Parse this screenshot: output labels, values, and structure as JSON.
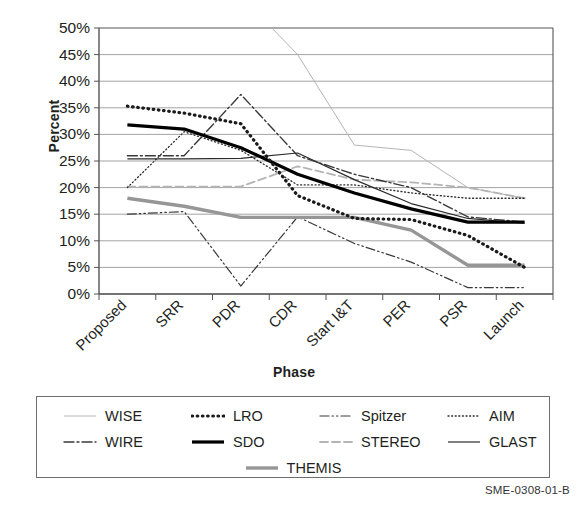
{
  "caption": "SME-0308-01-B",
  "top_partial_text": "",
  "axis": {
    "ylabel": "Percent",
    "xlabel": "Phase"
  },
  "chart_data": {
    "type": "line",
    "title": "",
    "xlabel": "Phase",
    "ylabel": "Percent",
    "ylim": [
      0,
      50
    ],
    "ytick_labels": [
      "0%",
      "5%",
      "10%",
      "15%",
      "20%",
      "25%",
      "30%",
      "35%",
      "40%",
      "45%",
      "50%"
    ],
    "ytick_values": [
      0,
      5,
      10,
      15,
      20,
      25,
      30,
      35,
      40,
      45,
      50
    ],
    "grid": true,
    "legend_position": "below",
    "categories": [
      "Proposed",
      "SRR",
      "PDR",
      "CDR",
      "Start I&T",
      "PER",
      "PSR",
      "Launch"
    ],
    "series": [
      {
        "name": "WISE",
        "style": "thin-solid-light",
        "color": "#b4b4b4",
        "width": 1,
        "dash": "none",
        "values": [
          null,
          null,
          56,
          45,
          28,
          27,
          20,
          18
        ]
      },
      {
        "name": "WIRE",
        "style": "dash-dot",
        "color": "#3a3a3a",
        "width": 1.4,
        "dash": "10,3,2,3",
        "values": [
          26,
          26,
          37.5,
          26,
          22.5,
          20,
          14.5,
          13.5
        ]
      },
      {
        "name": "LRO",
        "style": "thick-dotted",
        "color": "#1a1a1a",
        "width": 3.2,
        "dash": "0.6,4.6",
        "values": [
          35.3,
          34,
          32,
          18.5,
          14.2,
          14,
          11,
          5
        ]
      },
      {
        "name": "SDO",
        "style": "thick-solid",
        "color": "#000000",
        "width": 3.2,
        "dash": "none",
        "values": [
          31.8,
          31,
          27.5,
          22.5,
          19,
          16,
          13.5,
          13.5
        ]
      },
      {
        "name": "Spitzer",
        "style": "dash-dot-dot",
        "color": "#3a3a3a",
        "width": 1.2,
        "dash": "9,3,1.5,3,1.5,3",
        "values": [
          15,
          15.5,
          1.5,
          14.5,
          9.5,
          6,
          1.2,
          1.2
        ]
      },
      {
        "name": "STEREO",
        "style": "dashed-light",
        "color": "#b4b4b4",
        "width": 1.8,
        "dash": "8,4",
        "values": [
          20.2,
          20.2,
          20.2,
          24,
          21.5,
          21,
          20,
          18
        ]
      },
      {
        "name": "AIM",
        "style": "fine-dotted",
        "color": "#2a2a2a",
        "width": 1.3,
        "dash": "1,2.6",
        "values": [
          20,
          30.5,
          27,
          20.5,
          20.5,
          19,
          18,
          18
        ]
      },
      {
        "name": "GLAST",
        "style": "thin-solid",
        "color": "#2a2a2a",
        "width": 1.2,
        "dash": "none",
        "values": [
          25.4,
          25.4,
          25.5,
          26.5,
          21.5,
          17,
          14.2,
          13.3
        ]
      },
      {
        "name": "THEMIS",
        "style": "thick-solid-gray",
        "color": "#969696",
        "width": 3.4,
        "dash": "none",
        "values": [
          18,
          16.5,
          14.4,
          14.4,
          14.4,
          12,
          5.4,
          5.4
        ]
      }
    ]
  },
  "legend": {
    "items": [
      {
        "label": "WISE",
        "series": 0
      },
      {
        "label": "LRO",
        "series": 2
      },
      {
        "label": "Spitzer",
        "series": 4
      },
      {
        "label": "AIM",
        "series": 6
      },
      {
        "label": "WIRE",
        "series": 1
      },
      {
        "label": "SDO",
        "series": 3
      },
      {
        "label": "STEREO",
        "series": 5
      },
      {
        "label": "GLAST",
        "series": 7
      },
      {
        "label": "THEMIS",
        "series": 8
      }
    ]
  }
}
